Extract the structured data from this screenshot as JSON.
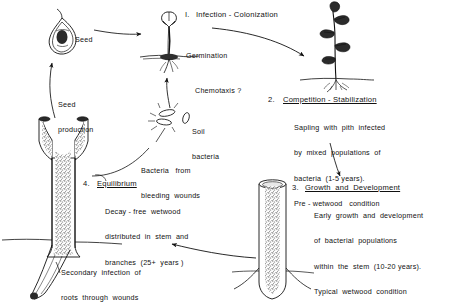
{
  "diagram": {
    "title_present": false,
    "background_color": "#ffffff",
    "ink_color": "#111111"
  },
  "stages": {
    "one": {
      "number": "I.",
      "heading": "Infection - Colonization",
      "sublabels": {
        "germination": "Germination",
        "chemotaxis": "Chemotaxis ?"
      }
    },
    "two": {
      "number": "2.",
      "heading": "Competition - Stabilization",
      "lines": [
        "Sapling  with  pith  infected",
        "by  mixed  populations  of",
        "bacteria  (1-5 years).",
        "Pre - wetwood   condition"
      ]
    },
    "three": {
      "number": "3.",
      "heading": "Growth  and  Development",
      "lines": [
        "Early  growth  and  development",
        "of  bacterial  populations",
        "within  the  stem  (10-20 years).",
        "Typical  wetwood  condition"
      ]
    },
    "four": {
      "number": "4.",
      "heading": "Equilibrium",
      "lines": [
        "Decay - free  wetwood",
        "distributed  in  stem  and",
        "branches  (25+  years )"
      ]
    }
  },
  "labels": {
    "seed": "Seed",
    "seed_production": [
      "Seed",
      "production"
    ],
    "soil_bacteria": [
      "Soil",
      "bacteria"
    ],
    "bacteria_wounds": [
      "Bacteria   from",
      "bleeding  wounds"
    ],
    "secondary_infection": [
      "Secondary  infection  of",
      "roots  through  wounds"
    ]
  }
}
